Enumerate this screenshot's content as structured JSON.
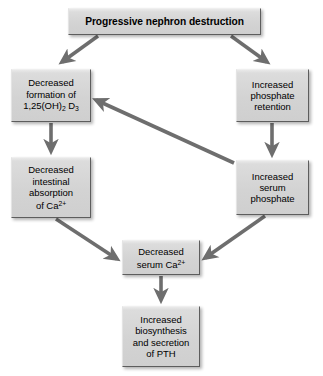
{
  "diagram": {
    "title": "Progressive nephron destruction",
    "background_color": "#ffffff",
    "node_fill_color": "#d5d5d5",
    "node_border_color": "#5d5d5d",
    "arrow_color": "#6e6e6e",
    "nodes": [
      {
        "id": "nephron-destruction",
        "text": "Progressive nephron destruction",
        "lines": [
          "Progressive nephron destruction"
        ],
        "bold": true,
        "x": 68,
        "y": 8,
        "w": 193,
        "h": 27
      },
      {
        "id": "decreased-vitamin-d",
        "text": "Decreased formation of 1,25(OH)2 D3",
        "lines": [
          "Decreased",
          "formation of",
          "1,25(OH)2 D3"
        ],
        "bold": false,
        "x": 11,
        "y": 69,
        "w": 80,
        "h": 53
      },
      {
        "id": "increased-phosphate-retention",
        "text": "Increased phosphate retention",
        "lines": [
          "Increased",
          "phosphate",
          "retention"
        ],
        "bold": false,
        "x": 236,
        "y": 69,
        "w": 73,
        "h": 53
      },
      {
        "id": "decreased-intestinal-absorption",
        "text": "Decreased intestinal absorption of Ca2+",
        "lines": [
          "Decreased",
          "intestinal",
          "absorption",
          "of Ca2+"
        ],
        "bold": false,
        "x": 11,
        "y": 157,
        "w": 80,
        "h": 61
      },
      {
        "id": "increased-serum-phosphate",
        "text": "Increased serum phosphate",
        "lines": [
          "Increased",
          "serum",
          "phosphate"
        ],
        "bold": false,
        "x": 236,
        "y": 160,
        "w": 73,
        "h": 55
      },
      {
        "id": "decreased-serum-calcium",
        "text": "Decreased serum Ca2+",
        "lines": [
          "Decreased",
          "serum Ca2+"
        ],
        "bold": false,
        "x": 122,
        "y": 240,
        "w": 78,
        "h": 35
      },
      {
        "id": "increased-pth",
        "text": "Increased biosynthesis and secretion of PTH",
        "lines": [
          "Increased",
          "biosynthesis",
          "and secretion",
          "of PTH"
        ],
        "bold": false,
        "x": 122,
        "y": 306,
        "w": 78,
        "h": 61
      }
    ],
    "edges": [
      {
        "id": "edge-destruction-to-vitamind",
        "from": "nephron-destruction",
        "to": "decreased-vitamin-d",
        "kind": "diagonal"
      },
      {
        "id": "edge-destruction-to-phosphate-retention",
        "from": "nephron-destruction",
        "to": "increased-phosphate-retention",
        "kind": "diagonal"
      },
      {
        "id": "edge-vitamind-to-intestinal",
        "from": "decreased-vitamin-d",
        "to": "decreased-intestinal-absorption",
        "kind": "vertical"
      },
      {
        "id": "edge-retention-to-serum-phosphate",
        "from": "increased-phosphate-retention",
        "to": "increased-serum-phosphate",
        "kind": "vertical"
      },
      {
        "id": "edge-serum-phosphate-to-vitamind",
        "from": "increased-serum-phosphate",
        "to": "decreased-vitamin-d",
        "kind": "diagonal"
      },
      {
        "id": "edge-intestinal-to-serum-calcium",
        "from": "decreased-intestinal-absorption",
        "to": "decreased-serum-calcium",
        "kind": "diagonal"
      },
      {
        "id": "edge-serum-phosphate-to-serum-calcium",
        "from": "increased-serum-phosphate",
        "to": "decreased-serum-calcium",
        "kind": "diagonal"
      },
      {
        "id": "edge-serum-calcium-to-pth",
        "from": "decreased-serum-calcium",
        "to": "increased-pth",
        "kind": "vertical"
      }
    ]
  }
}
